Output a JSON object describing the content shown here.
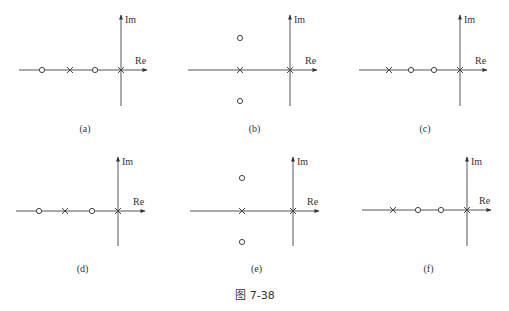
{
  "figure": {
    "caption": "图 7-38",
    "axis_labels": {
      "real": "Re",
      "imag": "Im"
    },
    "panels": [
      {
        "label": "(a)",
        "origin": [
          121,
          70
        ],
        "axis_h": [
          19,
          147
        ],
        "axis_v": [
          15,
          106
        ],
        "poles": [
          [
            70,
            70
          ],
          [
            121,
            70
          ]
        ],
        "zeros": [
          [
            42,
            70
          ],
          [
            95,
            70
          ]
        ]
      },
      {
        "label": "(b)",
        "origin": [
          290,
          70
        ],
        "axis_h": [
          188,
          317
        ],
        "axis_v": [
          15,
          106
        ],
        "poles": [
          [
            240,
            70
          ],
          [
            290,
            70
          ]
        ],
        "zeros": [
          [
            240,
            38
          ],
          [
            240,
            101
          ]
        ]
      },
      {
        "label": "(c)",
        "origin": [
          460,
          70
        ],
        "axis_h": [
          359,
          487
        ],
        "axis_v": [
          15,
          106
        ],
        "poles": [
          [
            389,
            70
          ],
          [
            460,
            70
          ]
        ],
        "zeros": [
          [
            411,
            70
          ],
          [
            434,
            70
          ]
        ]
      },
      {
        "label": "(d)",
        "origin": [
          118,
          211
        ],
        "axis_h": [
          16,
          145
        ],
        "axis_v": [
          157,
          246
        ],
        "poles": [
          [
            65,
            211
          ],
          [
            118,
            211
          ]
        ],
        "zeros": [
          [
            39,
            211
          ],
          [
            92,
            211
          ]
        ]
      },
      {
        "label": "(e)",
        "origin": [
          293,
          211
        ],
        "axis_h": [
          190,
          319
        ],
        "axis_v": [
          157,
          246
        ],
        "poles": [
          [
            242,
            211
          ],
          [
            293,
            211
          ]
        ],
        "zeros": [
          [
            242,
            178
          ],
          [
            242,
            242
          ]
        ]
      },
      {
        "label": "(f)",
        "origin": [
          467,
          210
        ],
        "axis_h": [
          362,
          491
        ],
        "axis_v": [
          157,
          246
        ],
        "poles": [
          [
            393,
            210
          ],
          [
            467,
            210
          ]
        ],
        "zeros": [
          [
            418,
            210
          ],
          [
            441,
            210
          ]
        ]
      }
    ]
  }
}
